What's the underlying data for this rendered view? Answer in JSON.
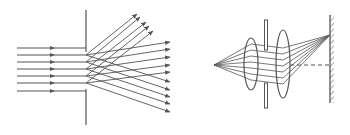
{
  "diagram": {
    "stroke_color": "#555555",
    "background": "#ffffff",
    "left_figure": {
      "name": "diffraction-grating",
      "incident_rays_y": [
        48,
        55,
        62,
        69,
        76,
        83,
        91
      ],
      "incident_x_start": 17,
      "incident_x_end": 86,
      "arrow_x": 53,
      "barrier": {
        "x": 86,
        "y_top": 10,
        "y_bottom": 125
      },
      "slit_y": [
        55,
        62,
        69,
        76,
        83
      ],
      "upper_ray_ends": [
        [
          137,
          14
        ],
        [
          140,
          17
        ],
        [
          146,
          22
        ],
        [
          149,
          26
        ],
        [
          153,
          31
        ]
      ],
      "middle_ray_ends": [
        [
          170,
          42
        ],
        [
          170,
          49
        ],
        [
          170,
          57
        ],
        [
          170,
          65
        ],
        [
          170,
          72
        ]
      ],
      "lower_ray_ends": [
        [
          170,
          82
        ],
        [
          170,
          90
        ],
        [
          170,
          97
        ],
        [
          170,
          104
        ],
        [
          170,
          112
        ]
      ]
    },
    "right_figure": {
      "name": "lens-system-with-mirror",
      "source": [
        214,
        65
      ],
      "lens1": {
        "cx": 251,
        "cy": 64,
        "rx": 7,
        "ry": 26
      },
      "aperture": {
        "x": 266,
        "top": [
          20,
          50
        ],
        "bottom": [
          83,
          108
        ]
      },
      "lens2": {
        "cx": 283,
        "cy": 64,
        "rx": 7,
        "ry": 34
      },
      "mirror": {
        "x": 330,
        "y_top": 15,
        "y_bottom": 103
      },
      "focus": [
        330,
        35
      ],
      "dashed_axis": {
        "x_start": 290,
        "x_end": 330,
        "y": 65
      },
      "ray_y_at_lens1": [
        44,
        50,
        56,
        62,
        68,
        74,
        80
      ],
      "ray_y_at_lens2": [
        48,
        54,
        60,
        66,
        72,
        78,
        84
      ]
    }
  }
}
